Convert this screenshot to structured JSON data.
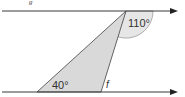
{
  "diagram": {
    "angles": {
      "apex_angle_label": "110°",
      "base_angle_label": "40°",
      "unknown_label": "f"
    },
    "top_mark": "g",
    "colors": {
      "line": "#3a3a3a",
      "triangle_fill": "#d9d9d9",
      "arc_fill": "#e6e6e6"
    }
  }
}
